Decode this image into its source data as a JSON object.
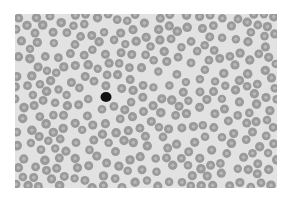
{
  "image": {
    "description": "Grayscale light micrograph of a blood smear showing many red blood cells with central pallor and a single dark-staining cell (lymphocyte) near the center-left",
    "colors": {
      "background": "#e2e2e2",
      "cell_rim": "#9a9a9a",
      "cell_center": "#b8b8b8",
      "dark_cell": "#111111"
    },
    "dark_cell_position": {
      "x": 106,
      "y": 97
    }
  }
}
